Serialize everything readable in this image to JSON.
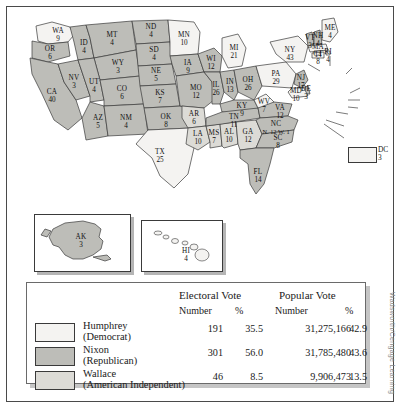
{
  "colors": {
    "humphrey": "#f4f3f1",
    "nixon": "#bdbdb8",
    "wallace": "#dcdbd6",
    "stroke": "#3a3a3a",
    "frame": "#4a4a4a",
    "text": "#1a1a1a"
  },
  "attribution": "Wadsworth/Cengage Learning",
  "dc": {
    "label": "DC",
    "votes": "3"
  },
  "insets": {
    "alaska": {
      "label": "AK",
      "votes": "3",
      "winner": "nixon"
    },
    "hawaii": {
      "label": "HI",
      "votes": "4",
      "winner": "humphrey"
    }
  },
  "chart_data": {
    "type": "map",
    "legend_position": "bottom",
    "columns": [
      "Electoral Vote Number",
      "Electoral Vote %",
      "Popular Vote Number",
      "Popular Vote %"
    ],
    "series": [
      {
        "name": "Humphrey (Democrat)",
        "electoral": 191,
        "electoral_pct": 35.5,
        "popular": 31275166,
        "popular_pct": 42.9
      },
      {
        "name": "Nixon (Republican)",
        "electoral": 301,
        "electoral_pct": 56.0,
        "popular": 31785480,
        "popular_pct": 43.6
      },
      {
        "name": "Wallace (American Independent)",
        "electoral": 46,
        "electoral_pct": 8.5,
        "popular": 9906473,
        "popular_pct": 13.5
      }
    ],
    "states": [
      {
        "code": "WA",
        "votes": 9,
        "winner": "humphrey"
      },
      {
        "code": "OR",
        "votes": 6,
        "winner": "nixon"
      },
      {
        "code": "CA",
        "votes": 40,
        "winner": "nixon"
      },
      {
        "code": "NV",
        "votes": 3,
        "winner": "nixon"
      },
      {
        "code": "ID",
        "votes": 4,
        "winner": "nixon"
      },
      {
        "code": "MT",
        "votes": 4,
        "winner": "nixon"
      },
      {
        "code": "WY",
        "votes": 3,
        "winner": "nixon"
      },
      {
        "code": "UT",
        "votes": 4,
        "winner": "nixon"
      },
      {
        "code": "AZ",
        "votes": 5,
        "winner": "nixon"
      },
      {
        "code": "CO",
        "votes": 6,
        "winner": "nixon"
      },
      {
        "code": "NM",
        "votes": 4,
        "winner": "nixon"
      },
      {
        "code": "ND",
        "votes": 4,
        "winner": "nixon"
      },
      {
        "code": "SD",
        "votes": 4,
        "winner": "nixon"
      },
      {
        "code": "NE",
        "votes": 5,
        "winner": "nixon"
      },
      {
        "code": "KS",
        "votes": 7,
        "winner": "nixon"
      },
      {
        "code": "OK",
        "votes": 8,
        "winner": "nixon"
      },
      {
        "code": "TX",
        "votes": 25,
        "winner": "humphrey"
      },
      {
        "code": "MN",
        "votes": 10,
        "winner": "humphrey"
      },
      {
        "code": "IA",
        "votes": 9,
        "winner": "nixon"
      },
      {
        "code": "MO",
        "votes": 12,
        "winner": "nixon"
      },
      {
        "code": "AR",
        "votes": 6,
        "winner": "wallace"
      },
      {
        "code": "LA",
        "votes": 10,
        "winner": "wallace"
      },
      {
        "code": "MS",
        "votes": 7,
        "winner": "wallace"
      },
      {
        "code": "AL",
        "votes": 10,
        "winner": "wallace"
      },
      {
        "code": "GA",
        "votes": 12,
        "winner": "wallace"
      },
      {
        "code": "WI",
        "votes": 12,
        "winner": "nixon"
      },
      {
        "code": "IL",
        "votes": 26,
        "winner": "nixon"
      },
      {
        "code": "MI",
        "votes": 21,
        "winner": "humphrey"
      },
      {
        "code": "IN",
        "votes": 13,
        "winner": "nixon"
      },
      {
        "code": "OH",
        "votes": 26,
        "winner": "nixon"
      },
      {
        "code": "KY",
        "votes": 9,
        "winner": "nixon"
      },
      {
        "code": "TN",
        "votes": 11,
        "winner": "nixon"
      },
      {
        "code": "WV",
        "votes": 7,
        "winner": "humphrey"
      },
      {
        "code": "VA",
        "votes": 12,
        "winner": "nixon"
      },
      {
        "code": "NC",
        "votes": 13,
        "winner": "split",
        "split_label": "N. 12  W. 1"
      },
      {
        "code": "SC",
        "votes": 8,
        "winner": "nixon"
      },
      {
        "code": "FL",
        "votes": 14,
        "winner": "nixon"
      },
      {
        "code": "PA",
        "votes": 29,
        "winner": "humphrey"
      },
      {
        "code": "NY",
        "votes": 43,
        "winner": "humphrey"
      },
      {
        "code": "VT",
        "votes": 3,
        "winner": "nixon"
      },
      {
        "code": "NH",
        "votes": 4,
        "winner": "nixon"
      },
      {
        "code": "ME",
        "votes": 4,
        "winner": "humphrey"
      },
      {
        "code": "MA",
        "votes": 14,
        "winner": "humphrey"
      },
      {
        "code": "RI",
        "votes": 4,
        "winner": "humphrey"
      },
      {
        "code": "CT",
        "votes": 8,
        "winner": "humphrey"
      },
      {
        "code": "NJ",
        "votes": 17,
        "winner": "nixon"
      },
      {
        "code": "DE",
        "votes": 3,
        "winner": "nixon"
      },
      {
        "code": "MD",
        "votes": 10,
        "winner": "humphrey"
      },
      {
        "code": "DC",
        "votes": 3,
        "winner": "humphrey"
      },
      {
        "code": "AK",
        "votes": 3,
        "winner": "nixon"
      },
      {
        "code": "HI",
        "votes": 4,
        "winner": "humphrey"
      }
    ]
  },
  "table": {
    "header_electoral": "Electoral Vote",
    "header_popular": "Popular Vote",
    "sub_number_1": "Number",
    "sub_pct_1": "%",
    "sub_number_2": "Number",
    "sub_pct_2": "%",
    "rows": [
      {
        "name_line1": "Humphrey",
        "name_line2": "(Democrat)",
        "electoral_number": "191",
        "electoral_pct": "35.5",
        "popular_number": "31,275,166",
        "popular_pct": "42.9",
        "swatch": "humphrey"
      },
      {
        "name_line1": "Nixon",
        "name_line2": "(Republican)",
        "electoral_number": "301",
        "electoral_pct": "56.0",
        "popular_number": "31,785,480",
        "popular_pct": "43.6",
        "swatch": "nixon"
      },
      {
        "name_line1": "Wallace",
        "name_line2": "(American Independent)",
        "electoral_number": "46",
        "electoral_pct": "8.5",
        "popular_number": "9,906,473",
        "popular_pct": "13.5",
        "swatch": "wallace"
      }
    ]
  }
}
